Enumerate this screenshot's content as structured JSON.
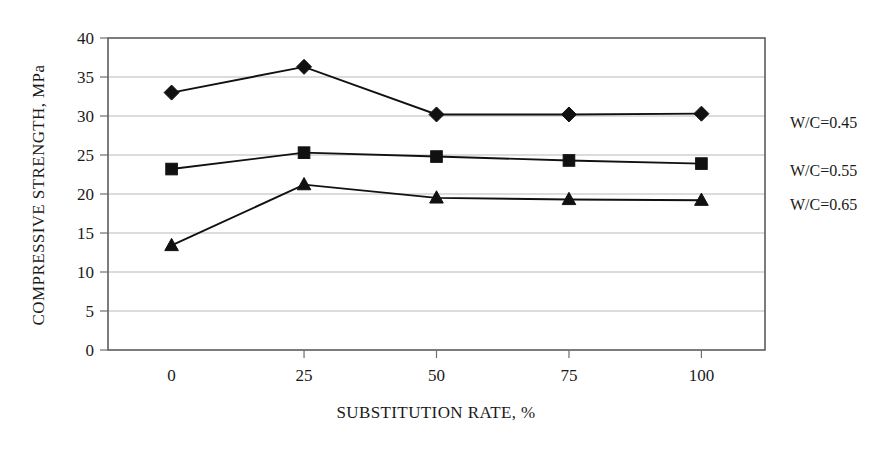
{
  "chart_data": {
    "type": "line",
    "title": "",
    "subtitle": "",
    "xlabel": "SUBSTITUTION RATE, %",
    "ylabel": "COMPRESSIVE STRENGTH, MPa",
    "x": [
      0,
      25,
      50,
      75,
      100
    ],
    "xtick_labels": [
      "0",
      "25",
      "50",
      "75",
      "100"
    ],
    "ytick_labels": [
      "0",
      "5",
      "10",
      "15",
      "20",
      "25",
      "30",
      "35",
      "40"
    ],
    "yticks": [
      0,
      5,
      10,
      15,
      20,
      25,
      30,
      35,
      40
    ],
    "xlim": [
      -12,
      112
    ],
    "ylim": [
      0,
      40
    ],
    "grid": "horizontal",
    "legend_position": "right-outside",
    "series": [
      {
        "name": "W/C=0.45",
        "marker": "diamond",
        "color": "#111111",
        "values": [
          33.0,
          36.3,
          30.2,
          30.2,
          30.3
        ]
      },
      {
        "name": "W/C=0.55",
        "marker": "square",
        "color": "#111111",
        "values": [
          23.2,
          25.3,
          24.8,
          24.3,
          23.9
        ]
      },
      {
        "name": "W/C=0.65",
        "marker": "triangle",
        "color": "#111111",
        "values": [
          13.4,
          21.2,
          19.5,
          19.3,
          19.2
        ]
      }
    ]
  },
  "legend": {
    "items": [
      {
        "label": "W/C=0.45"
      },
      {
        "label": "W/C=0.55"
      },
      {
        "label": "W/C=0.65"
      }
    ]
  },
  "axes": {
    "x_title": "SUBSTITUTION RATE, %",
    "y_title": "COMPRESSIVE STRENGTH, MPa"
  }
}
